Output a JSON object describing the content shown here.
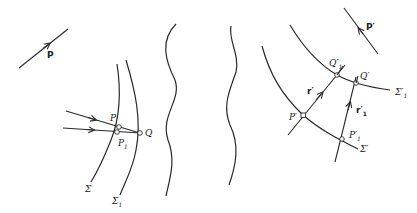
{
  "diagram": {
    "type": "optics-wavefront-propagation",
    "left_group": {
      "direction_vector": {
        "label": "P"
      },
      "surfaces": [
        {
          "id": "sigma",
          "label": "Σ",
          "sub": ""
        },
        {
          "id": "sigma1",
          "label": "Σ",
          "sub": "1"
        }
      ],
      "points": [
        {
          "id": "P",
          "label": "P",
          "sub": ""
        },
        {
          "id": "P1",
          "label": "P",
          "sub": "1"
        },
        {
          "id": "Q",
          "label": "Q",
          "sub": ""
        }
      ]
    },
    "separators": {
      "count": 2,
      "style": "wavy"
    },
    "right_group": {
      "direction_vector": {
        "label": "P′"
      },
      "surfaces": [
        {
          "id": "sigma-prime",
          "label": "Σ′",
          "sub": ""
        },
        {
          "id": "sigma1-prime",
          "label": "Σ′",
          "sub": "1"
        }
      ],
      "points": [
        {
          "id": "P-prime",
          "label": "P′",
          "sub": ""
        },
        {
          "id": "P1-prime",
          "label": "P′",
          "sub": "1"
        },
        {
          "id": "Q-prime",
          "label": "Q′",
          "sub": ""
        },
        {
          "id": "Q1-prime",
          "label": "Q′",
          "sub": "1"
        }
      ],
      "rays": [
        {
          "id": "r-prime",
          "label": "r′",
          "sub": ""
        },
        {
          "id": "r1-prime",
          "label": "r′",
          "sub": "1"
        }
      ]
    }
  }
}
